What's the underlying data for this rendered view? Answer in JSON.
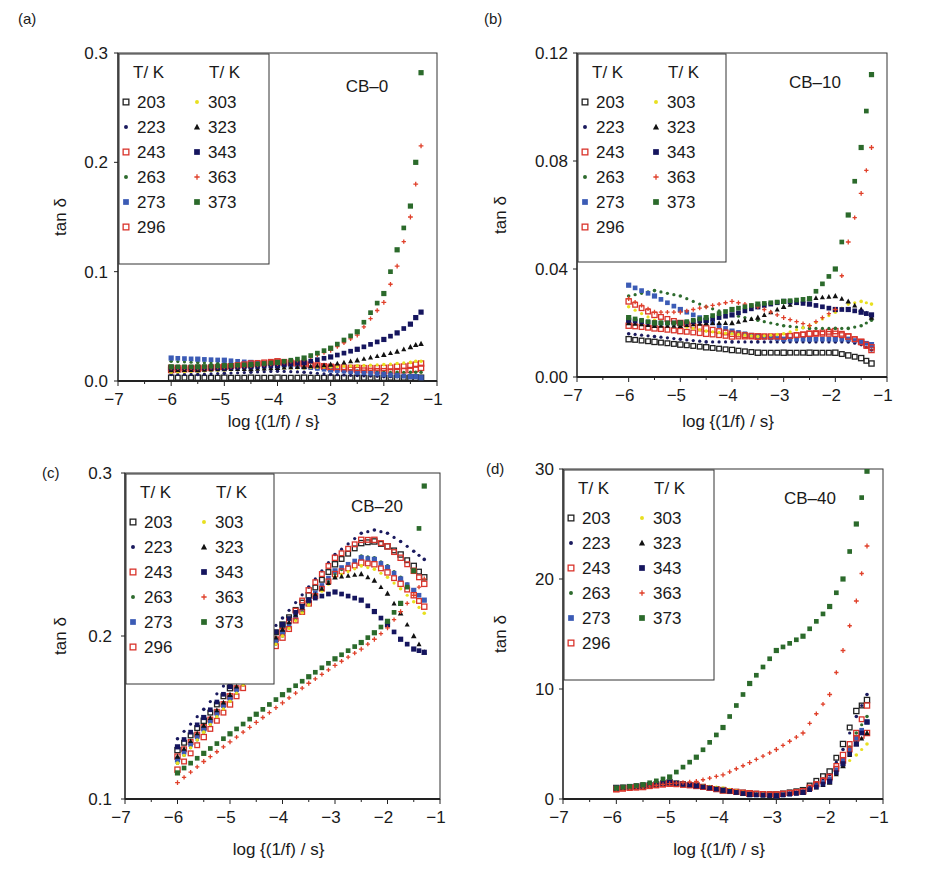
{
  "figure": {
    "xlabel": "log {(1/f) / s}",
    "ylabel": "tan δ",
    "legend_header": [
      "T/ K",
      "T/ K"
    ],
    "legend_left": [
      "203",
      "223",
      "243",
      "263",
      "273",
      "296"
    ],
    "legend_right": [
      "303",
      "323",
      "343",
      "363",
      "373"
    ]
  },
  "series_styles": {
    "203": {
      "color": "#222222",
      "marker": "open-square"
    },
    "223": {
      "color": "#1a1a5e",
      "marker": "dot"
    },
    "243": {
      "color": "#d9342b",
      "marker": "open-square"
    },
    "263": {
      "color": "#2e6b2e",
      "marker": "dot"
    },
    "273": {
      "color": "#3b5bb5",
      "marker": "square"
    },
    "296": {
      "color": "#d9342b",
      "marker": "open-square"
    },
    "303": {
      "color": "#e8e020",
      "marker": "dot"
    },
    "323": {
      "color": "#111111",
      "marker": "triangle"
    },
    "343": {
      "color": "#15155e",
      "marker": "square"
    },
    "363": {
      "color": "#e0402a",
      "marker": "plus"
    },
    "373": {
      "color": "#2b6a2b",
      "marker": "square"
    }
  },
  "chart_data": [
    {
      "panel": "(a)",
      "type": "scatter",
      "title": "CB–0",
      "xlabel": "log {(1/f) / s}",
      "ylabel": "tan δ",
      "xlim": [
        -7,
        -1
      ],
      "ylim": [
        0.0,
        0.3
      ],
      "xticks": [
        "−7",
        "−6",
        "−5",
        "−4",
        "−3",
        "−2",
        "−1"
      ],
      "yticks": [
        "0.0",
        "0.1",
        "0.2",
        "0.3"
      ],
      "x": [
        -6.0,
        -5.5,
        -5.0,
        -4.5,
        -4.0,
        -3.5,
        -3.0,
        -2.5,
        -2.0,
        -1.75,
        -1.5,
        -1.4,
        -1.3
      ],
      "series": [
        {
          "name": "203",
          "values": [
            0.003,
            0.003,
            0.003,
            0.003,
            0.003,
            0.003,
            0.003,
            0.003,
            0.003,
            0.003,
            0.003,
            0.003,
            0.003
          ]
        },
        {
          "name": "223",
          "values": [
            0.006,
            0.006,
            0.007,
            0.008,
            0.009,
            0.008,
            0.006,
            0.005,
            0.004,
            0.004,
            0.004,
            0.004,
            0.004
          ]
        },
        {
          "name": "243",
          "values": [
            0.012,
            0.012,
            0.013,
            0.015,
            0.017,
            0.015,
            0.012,
            0.01,
            0.009,
            0.009,
            0.01,
            0.011,
            0.012
          ]
        },
        {
          "name": "263",
          "values": [
            0.018,
            0.017,
            0.016,
            0.014,
            0.013,
            0.012,
            0.01,
            0.009,
            0.008,
            0.008,
            0.008,
            0.008,
            0.008
          ]
        },
        {
          "name": "273",
          "values": [
            0.021,
            0.02,
            0.019,
            0.017,
            0.015,
            0.013,
            0.01,
            0.008,
            0.006,
            0.005,
            0.004,
            0.004,
            0.003
          ]
        },
        {
          "name": "296",
          "values": [
            0.01,
            0.011,
            0.013,
            0.016,
            0.018,
            0.016,
            0.013,
            0.012,
            0.012,
            0.013,
            0.014,
            0.015,
            0.016
          ]
        },
        {
          "name": "303",
          "values": [
            0.008,
            0.009,
            0.01,
            0.011,
            0.012,
            0.012,
            0.013,
            0.014,
            0.015,
            0.016,
            0.017,
            0.018,
            0.018
          ]
        },
        {
          "name": "323",
          "values": [
            0.01,
            0.01,
            0.011,
            0.011,
            0.012,
            0.013,
            0.015,
            0.019,
            0.024,
            0.027,
            0.031,
            0.033,
            0.034
          ]
        },
        {
          "name": "343",
          "values": [
            0.012,
            0.012,
            0.012,
            0.013,
            0.014,
            0.017,
            0.022,
            0.029,
            0.038,
            0.044,
            0.052,
            0.058,
            0.063
          ]
        },
        {
          "name": "363",
          "values": [
            0.012,
            0.012,
            0.013,
            0.014,
            0.016,
            0.02,
            0.028,
            0.042,
            0.072,
            0.105,
            0.15,
            0.18,
            0.215
          ]
        },
        {
          "name": "373",
          "values": [
            0.013,
            0.013,
            0.014,
            0.015,
            0.017,
            0.021,
            0.03,
            0.045,
            0.08,
            0.12,
            0.16,
            0.2,
            0.282
          ]
        }
      ]
    },
    {
      "panel": "(b)",
      "type": "scatter",
      "title": "CB–10",
      "xlabel": "log {(1/f) / s}",
      "ylabel": "tan δ",
      "xlim": [
        -7,
        -1
      ],
      "ylim": [
        0.0,
        0.12
      ],
      "xticks": [
        "−7",
        "−6",
        "−5",
        "−4",
        "−3",
        "−2",
        "−1"
      ],
      "yticks": [
        "0.00",
        "0.04",
        "0.08",
        "0.12"
      ],
      "x": [
        -6.0,
        -5.5,
        -5.0,
        -4.5,
        -4.0,
        -3.5,
        -3.0,
        -2.5,
        -2.0,
        -1.75,
        -1.5,
        -1.3
      ],
      "series": [
        {
          "name": "203",
          "values": [
            0.014,
            0.013,
            0.012,
            0.011,
            0.01,
            0.009,
            0.009,
            0.009,
            0.009,
            0.008,
            0.007,
            0.005
          ]
        },
        {
          "name": "223",
          "values": [
            0.016,
            0.015,
            0.014,
            0.013,
            0.013,
            0.013,
            0.013,
            0.013,
            0.013,
            0.013,
            0.012,
            0.01
          ]
        },
        {
          "name": "243",
          "values": [
            0.019,
            0.018,
            0.017,
            0.016,
            0.015,
            0.015,
            0.015,
            0.016,
            0.017,
            0.015,
            0.013,
            0.01
          ]
        },
        {
          "name": "263",
          "values": [
            0.03,
            0.032,
            0.03,
            0.026,
            0.023,
            0.021,
            0.019,
            0.018,
            0.018,
            0.018,
            0.019,
            0.021
          ]
        },
        {
          "name": "273",
          "values": [
            0.034,
            0.03,
            0.025,
            0.021,
            0.017,
            0.015,
            0.014,
            0.014,
            0.014,
            0.014,
            0.013,
            0.012
          ]
        },
        {
          "name": "296",
          "values": [
            0.028,
            0.023,
            0.02,
            0.018,
            0.016,
            0.015,
            0.015,
            0.016,
            0.016,
            0.015,
            0.013,
            0.011
          ]
        },
        {
          "name": "303",
          "values": [
            0.026,
            0.021,
            0.019,
            0.017,
            0.016,
            0.015,
            0.016,
            0.019,
            0.024,
            0.027,
            0.028,
            0.027
          ]
        },
        {
          "name": "323",
          "values": [
            0.02,
            0.019,
            0.019,
            0.02,
            0.02,
            0.022,
            0.026,
            0.029,
            0.03,
            0.028,
            0.025,
            0.022
          ]
        },
        {
          "name": "343",
          "values": [
            0.021,
            0.02,
            0.02,
            0.021,
            0.023,
            0.026,
            0.028,
            0.027,
            0.025,
            0.025,
            0.024,
            0.023
          ]
        },
        {
          "name": "363",
          "values": [
            0.029,
            0.024,
            0.024,
            0.026,
            0.028,
            0.026,
            0.022,
            0.019,
            0.025,
            0.05,
            0.068,
            0.085
          ]
        },
        {
          "name": "373",
          "values": [
            0.022,
            0.02,
            0.02,
            0.022,
            0.025,
            0.027,
            0.028,
            0.029,
            0.04,
            0.06,
            0.085,
            0.112
          ]
        }
      ]
    },
    {
      "panel": "(c)",
      "type": "scatter",
      "title": "CB–20",
      "xlabel": "log {(1/f) / s}",
      "ylabel": "tan δ",
      "xlim": [
        -7,
        -1
      ],
      "ylim": [
        0.1,
        0.3
      ],
      "xticks": [
        "−7",
        "−6",
        "−5",
        "−4",
        "−3",
        "−2",
        "−1"
      ],
      "yticks": [
        "0.1",
        "0.2",
        "0.3"
      ],
      "x": [
        -6.0,
        -5.5,
        -5.0,
        -4.5,
        -4.0,
        -3.5,
        -3.0,
        -2.5,
        -2.25,
        -2.0,
        -1.75,
        -1.5,
        -1.3
      ],
      "series": [
        {
          "name": "203",
          "values": [
            0.13,
            0.148,
            0.168,
            0.188,
            0.207,
            0.225,
            0.244,
            0.257,
            0.258,
            0.255,
            0.25,
            0.243,
            0.236
          ]
        },
        {
          "name": "223",
          "values": [
            0.137,
            0.155,
            0.174,
            0.193,
            0.211,
            0.23,
            0.25,
            0.263,
            0.265,
            0.263,
            0.258,
            0.252,
            0.247
          ]
        },
        {
          "name": "243",
          "values": [
            0.126,
            0.144,
            0.163,
            0.183,
            0.203,
            0.228,
            0.248,
            0.259,
            0.259,
            0.255,
            0.248,
            0.24,
            0.232
          ]
        },
        {
          "name": "263",
          "values": [
            0.122,
            0.141,
            0.16,
            0.18,
            0.2,
            0.22,
            0.238,
            0.249,
            0.248,
            0.243,
            0.236,
            0.228,
            0.222
          ]
        },
        {
          "name": "273",
          "values": [
            0.124,
            0.143,
            0.162,
            0.182,
            0.202,
            0.222,
            0.24,
            0.248,
            0.247,
            0.242,
            0.235,
            0.228,
            0.222
          ]
        },
        {
          "name": "296",
          "values": [
            0.118,
            0.138,
            0.158,
            0.178,
            0.199,
            0.22,
            0.238,
            0.245,
            0.244,
            0.239,
            0.232,
            0.225,
            0.218
          ]
        },
        {
          "name": "303",
          "values": [
            0.122,
            0.141,
            0.16,
            0.18,
            0.2,
            0.219,
            0.236,
            0.243,
            0.241,
            0.236,
            0.229,
            0.221,
            0.214
          ]
        },
        {
          "name": "323",
          "values": [
            0.126,
            0.145,
            0.164,
            0.184,
            0.204,
            0.222,
            0.236,
            0.238,
            0.234,
            0.226,
            0.214,
            0.2,
            0.19
          ]
        },
        {
          "name": "343",
          "values": [
            0.132,
            0.15,
            0.169,
            0.189,
            0.207,
            0.222,
            0.227,
            0.222,
            0.215,
            0.207,
            0.198,
            0.192,
            0.19
          ]
        },
        {
          "name": "363",
          "values": [
            0.11,
            0.123,
            0.135,
            0.147,
            0.159,
            0.171,
            0.182,
            0.192,
            0.198,
            0.205,
            0.215,
            0.225,
            0.235
          ]
        },
        {
          "name": "373",
          "values": [
            0.116,
            0.128,
            0.14,
            0.152,
            0.164,
            0.175,
            0.186,
            0.196,
            0.202,
            0.209,
            0.22,
            0.24,
            0.292
          ]
        }
      ]
    },
    {
      "panel": "(d)",
      "type": "scatter",
      "title": "CB–40",
      "xlabel": "log {(1/f) / s}",
      "ylabel": "tan δ",
      "xlim": [
        -7,
        -1
      ],
      "ylim": [
        0,
        30
      ],
      "xticks": [
        "−7",
        "−6",
        "−5",
        "−4",
        "−3",
        "−2",
        "−1"
      ],
      "yticks": [
        "0",
        "10",
        "20",
        "30"
      ],
      "x": [
        -6.0,
        -5.5,
        -5.0,
        -4.5,
        -4.0,
        -3.5,
        -3.0,
        -2.5,
        -2.0,
        -1.75,
        -1.5,
        -1.3
      ],
      "series": [
        {
          "name": "203",
          "values": [
            1.0,
            1.2,
            1.5,
            1.2,
            0.8,
            0.5,
            0.4,
            0.8,
            2.5,
            5.0,
            8.0,
            9.0
          ]
        },
        {
          "name": "223",
          "values": [
            1.0,
            1.2,
            1.5,
            1.2,
            0.8,
            0.4,
            0.3,
            0.7,
            2.2,
            4.5,
            7.5,
            9.5
          ]
        },
        {
          "name": "243",
          "values": [
            0.9,
            1.1,
            1.4,
            1.2,
            0.8,
            0.5,
            0.4,
            0.7,
            2.0,
            4.0,
            6.0,
            8.5
          ]
        },
        {
          "name": "263",
          "values": [
            1.0,
            1.2,
            1.5,
            1.2,
            0.8,
            0.4,
            0.3,
            0.6,
            1.8,
            3.5,
            6.0,
            7.5
          ]
        },
        {
          "name": "273",
          "values": [
            1.0,
            1.2,
            1.5,
            1.2,
            0.8,
            0.4,
            0.3,
            0.6,
            1.8,
            3.5,
            5.5,
            7.0
          ]
        },
        {
          "name": "296",
          "values": [
            0.9,
            1.1,
            1.4,
            1.2,
            0.8,
            0.5,
            0.4,
            0.7,
            2.0,
            3.5,
            5.5,
            6.0
          ]
        },
        {
          "name": "303",
          "values": [
            0.9,
            1.1,
            1.4,
            1.3,
            1.0,
            0.5,
            0.4,
            0.6,
            1.5,
            3.0,
            4.0,
            5.0
          ]
        },
        {
          "name": "323",
          "values": [
            1.0,
            1.2,
            1.5,
            1.2,
            0.8,
            0.4,
            0.3,
            0.6,
            1.5,
            3.0,
            5.0,
            6.0
          ]
        },
        {
          "name": "343",
          "values": [
            1.0,
            1.2,
            1.5,
            1.2,
            0.8,
            0.4,
            0.3,
            0.6,
            1.6,
            3.2,
            5.0,
            7.0
          ]
        },
        {
          "name": "363",
          "values": [
            0.9,
            1.1,
            1.4,
            1.6,
            2.2,
            3.3,
            4.5,
            6.0,
            9.5,
            13.5,
            18.0,
            23.0
          ]
        },
        {
          "name": "373",
          "values": [
            1.0,
            1.3,
            2.0,
            3.8,
            6.5,
            10.5,
            13.5,
            14.8,
            17.5,
            20.0,
            25.0,
            29.8
          ]
        }
      ]
    }
  ]
}
